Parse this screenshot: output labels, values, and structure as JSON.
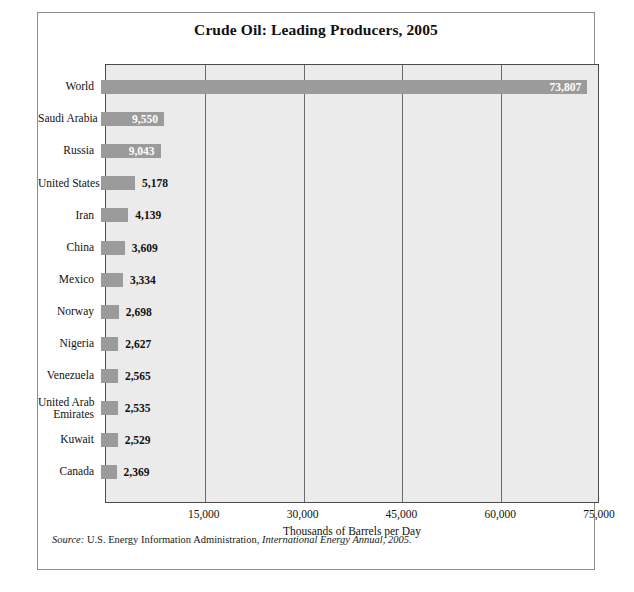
{
  "figure": {
    "title": "Crude Oil: Leading Producers, 2005",
    "source_prefix": "Source:",
    "source_text": " U.S. Energy Information Administration, ",
    "source_italic": "International Energy Annual, 2005.",
    "bar_color": "#9b9b9b",
    "plot_background": "#ebebeb",
    "gridline_color": "#6b6b6b",
    "frame_color": "#8d8d8d"
  },
  "chart_data": {
    "type": "bar",
    "orientation": "horizontal",
    "title": "Crude Oil: Leading Producers, 2005",
    "xlabel": "Thousands of Barrels per Day",
    "ylabel": "",
    "xlim": [
      0,
      75000
    ],
    "xticks": [
      "15,000",
      "30,000",
      "45,000",
      "60,000",
      "75,000"
    ],
    "xtick_values": [
      15000,
      30000,
      45000,
      60000,
      75000
    ],
    "grid": true,
    "grid_axis": "x",
    "legend": false,
    "categories": [
      "World",
      "Saudi Arabia",
      "Russia",
      "United States",
      "Iran",
      "China",
      "Mexico",
      "Norway",
      "Nigeria",
      "Venezuela",
      "United Arab Emirates",
      "Kuwait",
      "Canada"
    ],
    "values": [
      73807,
      9550,
      9043,
      5178,
      4139,
      3609,
      3334,
      2698,
      2627,
      2565,
      2535,
      2529,
      2369
    ],
    "value_labels": [
      "73,807",
      "9,550",
      "9,043",
      "5,178",
      "4,139",
      "3,609",
      "3,334",
      "2,698",
      "2,627",
      "2,565",
      "2,535",
      "2,529",
      "2,369"
    ],
    "rows": [
      {
        "label_lines": [
          "World"
        ],
        "value": 73807,
        "value_label": "73,807",
        "label_position": "inside"
      },
      {
        "label_lines": [
          "Saudi Arabia"
        ],
        "value": 9550,
        "value_label": "9,550",
        "label_position": "inside"
      },
      {
        "label_lines": [
          "Russia"
        ],
        "value": 9043,
        "value_label": "9,043",
        "label_position": "inside"
      },
      {
        "label_lines": [
          "United States"
        ],
        "value": 5178,
        "value_label": "5,178",
        "label_position": "outside"
      },
      {
        "label_lines": [
          "Iran"
        ],
        "value": 4139,
        "value_label": "4,139",
        "label_position": "outside"
      },
      {
        "label_lines": [
          "China"
        ],
        "value": 3609,
        "value_label": "3,609",
        "label_position": "outside"
      },
      {
        "label_lines": [
          "Mexico"
        ],
        "value": 3334,
        "value_label": "3,334",
        "label_position": "outside"
      },
      {
        "label_lines": [
          "Norway"
        ],
        "value": 2698,
        "value_label": "2,698",
        "label_position": "outside"
      },
      {
        "label_lines": [
          "Nigeria"
        ],
        "value": 2627,
        "value_label": "2,627",
        "label_position": "outside"
      },
      {
        "label_lines": [
          "Venezuela"
        ],
        "value": 2565,
        "value_label": "2,565",
        "label_position": "outside"
      },
      {
        "label_lines": [
          "United Arab",
          "Emirates"
        ],
        "value": 2535,
        "value_label": "2,535",
        "label_position": "outside"
      },
      {
        "label_lines": [
          "Kuwait"
        ],
        "value": 2529,
        "value_label": "2,529",
        "label_position": "outside"
      },
      {
        "label_lines": [
          "Canada"
        ],
        "value": 2369,
        "value_label": "2,369",
        "label_position": "outside"
      }
    ]
  }
}
